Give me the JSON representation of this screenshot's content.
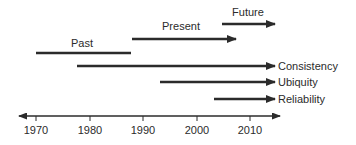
{
  "diagram": {
    "type": "timeline",
    "line_color": "#2b2b2b",
    "axis": {
      "start_year": 1965,
      "end_year": 2015,
      "ticks": [
        {
          "year": 1970,
          "label": "1970"
        },
        {
          "year": 1980,
          "label": "1980"
        },
        {
          "year": 1990,
          "label": "1990"
        },
        {
          "year": 2000,
          "label": "2000"
        },
        {
          "year": 2010,
          "label": "2010"
        }
      ],
      "arrows": "both"
    },
    "eras": [
      {
        "id": "past",
        "label": "Past",
        "start": 1970,
        "end": 1988,
        "arrow": false
      },
      {
        "id": "present",
        "label": "Present",
        "start": 1988,
        "end": 2008,
        "arrow": true
      },
      {
        "id": "future",
        "label": "Future",
        "start": 2005,
        "end": 2015,
        "arrow": true
      }
    ],
    "properties": [
      {
        "id": "consistency",
        "label": "Consistency",
        "start": 1978,
        "end": 2015
      },
      {
        "id": "ubiquity",
        "label": "Ubiquity",
        "start": 1993,
        "end": 2015
      },
      {
        "id": "reliability",
        "label": "Reliability",
        "start": 2003,
        "end": 2015
      }
    ]
  }
}
